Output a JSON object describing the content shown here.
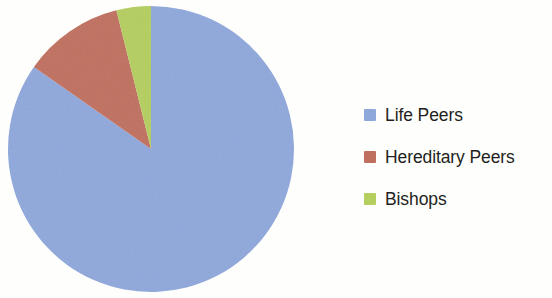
{
  "chart_data": {
    "type": "pie",
    "title": "",
    "subtitle": "",
    "xlabel": "",
    "ylabel": "",
    "grid": false,
    "legend_position": "right",
    "start_angle_deg": 0,
    "direction": "clockwise",
    "categories": [
      "Life Peers",
      "Hereditary Peers",
      "Bishops"
    ],
    "values": [
      84.7,
      11.4,
      3.9
    ],
    "value_unit": "percent",
    "colors": [
      "#8fa8dc",
      "#c0705e",
      "#b4cf5f"
    ],
    "slices": [
      {
        "label": "Life Peers",
        "value": 84.7,
        "color": "#8fa8dc",
        "start_deg": 55,
        "sweep_deg": 305
      },
      {
        "label": "Hereditary Peers",
        "value": 11.4,
        "color": "#c0705e",
        "start_deg": 14,
        "sweep_deg": 41
      },
      {
        "label": "Bishops",
        "value": 3.9,
        "color": "#b4cf5f",
        "start_deg": 0,
        "sweep_deg": 14
      }
    ]
  },
  "legend": {
    "items": [
      {
        "label": "Life Peers",
        "color": "#8fa8dc",
        "swatch": "legend-swatch-life-peers"
      },
      {
        "label": "Hereditary Peers",
        "color": "#c0705e",
        "swatch": "legend-swatch-hereditary-peers"
      },
      {
        "label": "Bishops",
        "color": "#b4cf5f",
        "swatch": "legend-swatch-bishops"
      }
    ]
  },
  "pie": {
    "center_x": 151,
    "center_y": 149,
    "radius": 143
  }
}
